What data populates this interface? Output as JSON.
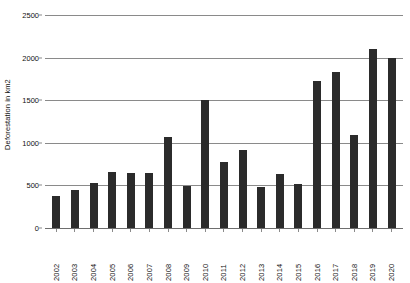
{
  "chart_data": {
    "type": "bar",
    "title": "",
    "xlabel": "",
    "ylabel": "Deforestation in km2",
    "ylim": [
      0,
      2500
    ],
    "yticks": [
      0,
      500,
      1000,
      1500,
      2000,
      2500
    ],
    "ytick_labels": [
      "0",
      "500",
      "1000",
      "1500",
      "2000",
      "2500"
    ],
    "grid": true,
    "legend": null,
    "bar_color": "#2b2b2b",
    "categories": [
      "2002",
      "2003",
      "2004",
      "2005",
      "2006",
      "2007",
      "2008",
      "2009",
      "2010",
      "2011",
      "2012",
      "2013",
      "2014",
      "2015",
      "2016",
      "2017",
      "2018",
      "2019",
      "2020"
    ],
    "values": [
      380,
      450,
      530,
      660,
      650,
      640,
      1070,
      490,
      1500,
      770,
      910,
      480,
      630,
      520,
      1720,
      1830,
      1090,
      2100,
      2000
    ]
  }
}
